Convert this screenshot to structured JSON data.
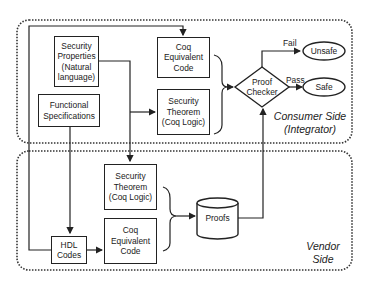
{
  "diagram": {
    "regions": {
      "consumer": {
        "label_line1": "Consumer Side",
        "label_line2": "(Integrator)"
      },
      "vendor": {
        "label_line1": "Vendor",
        "label_line2": "Side"
      }
    },
    "nodes": {
      "security_properties": {
        "lines": [
          "Security",
          "Properties",
          "(Natural",
          "language)"
        ],
        "text": "Security Properties (Natural language)"
      },
      "functional_specifications": {
        "lines": [
          "Functional",
          "Specifications"
        ],
        "text": "Functional Specifications"
      },
      "consumer_coq_code": {
        "lines": [
          "Coq",
          "Equivalent",
          "Code"
        ],
        "text": "Coq Equivalent Code"
      },
      "consumer_security_theorem": {
        "lines": [
          "Security",
          "Theorem",
          "(Coq Logic)"
        ],
        "text": "Security Theorem (Coq Logic)"
      },
      "proof_checker": {
        "lines": [
          "Proof",
          "Checker"
        ],
        "text": "Proof Checker"
      },
      "unsafe": {
        "text": "Unsafe"
      },
      "safe": {
        "text": "Safe"
      },
      "vendor_security_theorem": {
        "lines": [
          "Security",
          "Theorem",
          "(Coq Logic)"
        ],
        "text": "Security Theorem (Coq Logic)"
      },
      "vendor_coq_code": {
        "lines": [
          "Coq",
          "Equivalent",
          "Code"
        ],
        "text": "Coq Equivalent Code"
      },
      "hdl_codes": {
        "lines": [
          "HDL",
          "Codes"
        ],
        "text": "HDL Codes"
      },
      "proofs": {
        "text": "Proofs"
      }
    },
    "edges": {
      "fail_label": "Fail",
      "pass_label": "Pass"
    }
  }
}
